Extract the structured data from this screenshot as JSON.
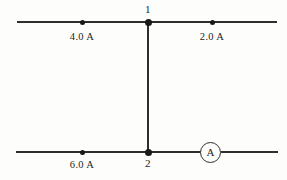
{
  "diagram": {
    "colors": {
      "wire": "#2e2e2e",
      "node": "#1a1a1a",
      "text": "#1d1d1d",
      "background": "#fdfdfb"
    },
    "nodes": [
      {
        "id": "node-1",
        "label": "1"
      },
      {
        "id": "node-2",
        "label": "2"
      }
    ],
    "branches": [
      {
        "id": "branch-top-left",
        "current": "4.0 A"
      },
      {
        "id": "branch-top-right",
        "current": "2.0 A"
      },
      {
        "id": "branch-bottom-left",
        "current": "6.0 A"
      }
    ],
    "instruments": [
      {
        "id": "ammeter",
        "symbol": "A"
      }
    ]
  }
}
